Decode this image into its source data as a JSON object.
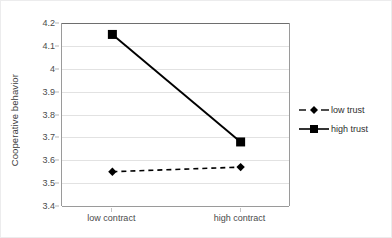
{
  "chart_data": {
    "type": "line",
    "title": "",
    "xlabel": "",
    "ylabel": "Cooperative behavior",
    "categories": [
      "low contract",
      "high contract"
    ],
    "series": [
      {
        "name": "low trust",
        "values": [
          3.55,
          3.57
        ],
        "style": "dashed",
        "marker": "diamond",
        "color": "#000000"
      },
      {
        "name": "high trust",
        "values": [
          4.15,
          3.68
        ],
        "style": "solid",
        "marker": "square",
        "color": "#000000"
      }
    ],
    "ylim": [
      3.4,
      4.2
    ],
    "yticks": [
      "3.4",
      "3.5",
      "3.6",
      "3.7",
      "3.8",
      "3.9",
      "4",
      "4.1",
      "4.2"
    ],
    "ytick_values": [
      3.4,
      3.5,
      3.6,
      3.7,
      3.8,
      3.9,
      4.0,
      4.1,
      4.2
    ],
    "grid": true,
    "legend_position": "right"
  },
  "legend": {
    "entries": [
      {
        "label": "low trust"
      },
      {
        "label": "high trust"
      }
    ]
  },
  "axis": {
    "y_title": "Cooperative behavior"
  }
}
